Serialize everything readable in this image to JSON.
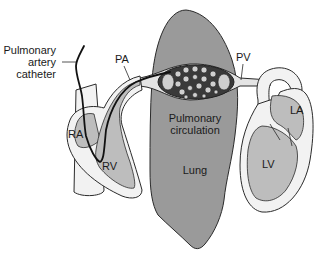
{
  "diagram": {
    "labels": {
      "catheter_line1": "Pulmonary",
      "catheter_line2": "artery",
      "catheter_line3": "catheter",
      "pa": "PA",
      "pv": "PV",
      "ra": "RA",
      "rv": "RV",
      "la": "LA",
      "lv": "LV",
      "pulm_line1": "Pulmonary",
      "pulm_line2": "circulation",
      "lung": "Lung"
    },
    "colors": {
      "lung_fill": "#9a9a9a",
      "chamber_fill": "#bdbdbd",
      "wall_fill": "#f2f2f2",
      "outline": "#2a2a2a",
      "catheter": "#111111",
      "background": "#ffffff"
    }
  }
}
